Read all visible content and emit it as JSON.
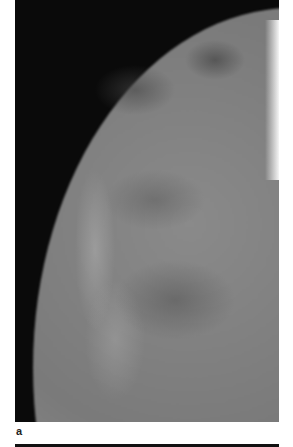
{
  "figure": {
    "panel_label": "a",
    "image_description": "Mammogram, craniocaudal/oblique view showing breast parenchyma with fibroglandular tissue",
    "colors": {
      "background": "#0a0a0a",
      "page": "#ffffff"
    }
  }
}
